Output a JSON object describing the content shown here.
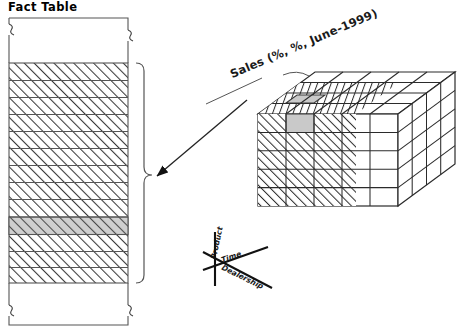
{
  "figure": {
    "title": "Fact Table",
    "background_color": "#ffffff",
    "stroke_color": "#333333",
    "highlight_color": "#cccccc"
  },
  "fact_table": {
    "label": "Fact Table",
    "row_count": 13,
    "highlighted_row_index": 9,
    "has_top_break": true,
    "has_bottom_break": true,
    "fill": "hatch-diagonal"
  },
  "brace": {
    "name": "right-curly-brace",
    "orientation": "right",
    "tip_label": ""
  },
  "arrow": {
    "name": "cube-to-table-arrow",
    "direction": "left",
    "from": "data-cube",
    "to": "fact-table-brace"
  },
  "cube": {
    "callout_label": "Sales (%, %, June-1999)",
    "columns": 5,
    "rows": 5,
    "depth": 4,
    "hatched_region": "front-left",
    "highlighted_cell": "top-face-front-left",
    "highlight_color": "#cccccc"
  },
  "axes_legend": {
    "vertical_label": "Product",
    "horizontal_label": "Time",
    "diagonal_label": "Dealership"
  }
}
